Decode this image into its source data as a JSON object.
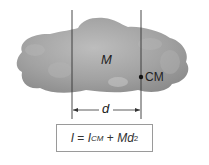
{
  "diagram": {
    "body_label": "M",
    "cm_label": "CM",
    "distance_label": "d",
    "formula": {
      "lhs": "I",
      "eq": " = ",
      "icm_base": "I",
      "icm_sub": "CM",
      "plus": " + ",
      "md": "Md",
      "exp": "2"
    },
    "colors": {
      "body_fill": "#9a9a9a",
      "body_highlight": "#b8b8b8",
      "lines": "#333333",
      "cm_dot": "#111111",
      "box_border": "#9a9a9a"
    }
  }
}
